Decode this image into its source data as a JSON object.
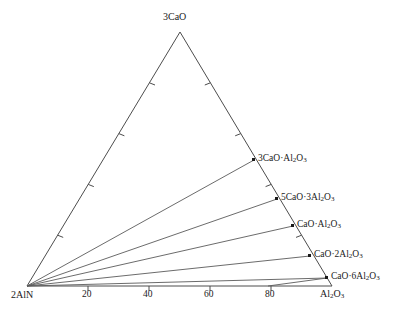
{
  "figure": {
    "type": "ternary-phase-diagram",
    "background_color": "#ffffff",
    "line_color": "#4d4d4d",
    "text_color": "#1a1a1a"
  },
  "corners": {
    "top": "3CaO",
    "bottom_left": "2AlN",
    "bottom_right_base": "Al",
    "bottom_right_sub": "2",
    "bottom_right_tail": "O",
    "bottom_right_sub2": "3"
  },
  "axis": {
    "bottom_ticks": [
      "20",
      "40",
      "60",
      "80"
    ],
    "bottom_tick_values": [
      20,
      40,
      60,
      80
    ]
  },
  "phases": [
    {
      "id": "c3a",
      "label_html": "3CaO·Al<sub>2</sub>O<sub>3</sub>",
      "label_text": "3CaO·Al2O3"
    },
    {
      "id": "c5a3",
      "label_html": "5CaO·3Al<sub>2</sub>O<sub>3</sub>",
      "label_text": "5CaO·3Al2O3"
    },
    {
      "id": "ca",
      "label_html": "CaO·Al<sub>2</sub>O<sub>3</sub>",
      "label_text": "CaO·Al2O3"
    },
    {
      "id": "ca2",
      "label_html": "CaO·2Al<sub>2</sub>O<sub>3</sub>",
      "label_text": "CaO·2Al2O3"
    },
    {
      "id": "ca6",
      "label_html": "CaO·6Al<sub>2</sub>O<sub>3</sub>",
      "label_text": "CaO·6Al2O3"
    }
  ],
  "chart_data": {
    "type": "scatter",
    "title": "",
    "xlabel": "",
    "ylabel": "",
    "diagram_kind": "ternary",
    "vertices": {
      "top": {
        "name": "3CaO",
        "x": 180,
        "y": 32
      },
      "bottom_left": {
        "name": "2AlN",
        "x": 27,
        "y": 286
      },
      "bottom_right": {
        "name": "Al2O3",
        "x": 332,
        "y": 286
      }
    },
    "bottom_axis": {
      "tick_labels": [
        "20",
        "40",
        "60",
        "80"
      ],
      "tick_fractions": [
        0.2,
        0.4,
        0.6,
        0.8
      ],
      "range": [
        0,
        100
      ]
    },
    "left_edge_tick_fractions": [
      0.2,
      0.4,
      0.6,
      0.8
    ],
    "right_edge_tick_fractions": [
      0.2,
      0.4,
      0.6,
      0.8
    ],
    "points": [
      {
        "name": "3CaO·Al2O3",
        "edge_fraction_from_Al2O3": 0.5,
        "x": 254,
        "y": 160
      },
      {
        "name": "5CaO·3Al2O3",
        "edge_fraction_from_Al2O3": 0.345,
        "x": 277,
        "y": 199
      },
      {
        "name": "CaO·Al2O3",
        "edge_fraction_from_Al2O3": 0.237,
        "x": 293,
        "y": 226
      },
      {
        "name": "CaO·2Al2O3",
        "edge_fraction_from_Al2O3": 0.119,
        "x": 310,
        "y": 256
      },
      {
        "name": "CaO·6Al2O3",
        "edge_fraction_from_Al2O3": 0.032,
        "x": 327,
        "y": 278
      }
    ],
    "tie_lines": [
      {
        "from": "2AlN",
        "to": "3CaO·Al2O3"
      },
      {
        "from": "2AlN",
        "to": "5CaO·3Al2O3"
      },
      {
        "from": "2AlN",
        "to": "CaO·Al2O3"
      },
      {
        "from": "2AlN",
        "to": "CaO·2Al2O3"
      },
      {
        "from": "2AlN",
        "to": "CaO·6Al2O3"
      },
      {
        "from": "CaO·6Al2O3",
        "to": "bottom-axis-at-x-268"
      }
    ]
  }
}
